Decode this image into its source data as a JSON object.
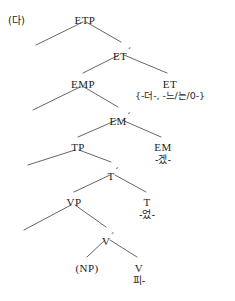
{
  "figure": {
    "example_label": "(다)",
    "width": 235,
    "height": 301,
    "line_color": "#555555",
    "text_color": "#1c1c1c"
  },
  "tree": {
    "nodes": [
      {
        "id": "ETP",
        "label": "ETP",
        "bar": "",
        "morph": "",
        "x": 85,
        "y": 14
      },
      {
        "id": "ETbar",
        "label": "ET",
        "bar": "´",
        "morph": "",
        "x": 122,
        "y": 46
      },
      {
        "id": "EMP",
        "label": "EMP",
        "bar": "",
        "morph": "",
        "x": 83,
        "y": 78
      },
      {
        "id": "ET",
        "label": "ET",
        "bar": "",
        "morph": "{-더-, -느/는/0-}",
        "x": 170,
        "y": 78
      },
      {
        "id": "EMbar",
        "label": "EM",
        "bar": "´",
        "morph": "",
        "x": 120,
        "y": 111
      },
      {
        "id": "TP",
        "label": "TP",
        "bar": "",
        "morph": "",
        "x": 78,
        "y": 141
      },
      {
        "id": "EM",
        "label": "EM",
        "bar": "",
        "morph": "-겠-",
        "x": 163,
        "y": 141
      },
      {
        "id": "Tbar",
        "label": "T",
        "bar": "´",
        "morph": "",
        "x": 113,
        "y": 166
      },
      {
        "id": "VP",
        "label": "VP",
        "bar": "",
        "morph": "",
        "x": 74,
        "y": 196
      },
      {
        "id": "T",
        "label": "T",
        "bar": "",
        "morph": "-었-",
        "x": 147,
        "y": 196
      },
      {
        "id": "Vbar",
        "label": "V",
        "bar": "´",
        "morph": "",
        "x": 108,
        "y": 231
      },
      {
        "id": "NP",
        "label": "(NP)",
        "bar": "",
        "morph": "",
        "x": 87,
        "y": 262
      },
      {
        "id": "V",
        "label": "V",
        "bar": "",
        "morph": "피-",
        "x": 139,
        "y": 262
      }
    ],
    "branches": [
      {
        "from": "ETP",
        "to": "spec-etp",
        "type": "empty-specifier"
      },
      {
        "from": "ETP",
        "to": "ETbar",
        "type": "projection"
      },
      {
        "from": "ETbar",
        "to": "EMP",
        "type": "projection"
      },
      {
        "from": "ETbar",
        "to": "ET",
        "type": "head"
      },
      {
        "from": "EMP",
        "to": "spec-emp",
        "type": "empty-specifier"
      },
      {
        "from": "EMP",
        "to": "EMbar",
        "type": "projection"
      },
      {
        "from": "EMbar",
        "to": "TP",
        "type": "projection"
      },
      {
        "from": "EMbar",
        "to": "EM",
        "type": "head"
      },
      {
        "from": "TP",
        "to": "spec-tp",
        "type": "empty-specifier"
      },
      {
        "from": "TP",
        "to": "Tbar",
        "type": "projection"
      },
      {
        "from": "Tbar",
        "to": "VP",
        "type": "projection"
      },
      {
        "from": "Tbar",
        "to": "T",
        "type": "head"
      },
      {
        "from": "VP",
        "to": "spec-vp",
        "type": "empty-specifier"
      },
      {
        "from": "VP",
        "to": "Vbar",
        "type": "projection"
      },
      {
        "from": "Vbar",
        "to": "NP",
        "type": "complement"
      },
      {
        "from": "Vbar",
        "to": "V",
        "type": "head"
      }
    ],
    "lines": [
      {
        "name": "branch-etp-spec",
        "x1": 83,
        "y1": 22,
        "x2": 36,
        "y2": 45
      },
      {
        "name": "branch-etp-etbar",
        "x1": 86,
        "y1": 22,
        "x2": 121,
        "y2": 42
      },
      {
        "name": "branch-etbar-emp",
        "x1": 119,
        "y1": 55,
        "x2": 83,
        "y2": 73
      },
      {
        "name": "branch-etbar-et",
        "x1": 124,
        "y1": 55,
        "x2": 167,
        "y2": 73
      },
      {
        "name": "branch-emp-spec",
        "x1": 80,
        "y1": 87,
        "x2": 33,
        "y2": 110
      },
      {
        "name": "branch-emp-embar",
        "x1": 84,
        "y1": 87,
        "x2": 118,
        "y2": 107
      },
      {
        "name": "branch-embar-tp",
        "x1": 117,
        "y1": 120,
        "x2": 78,
        "y2": 137
      },
      {
        "name": "branch-embar-em",
        "x1": 122,
        "y1": 120,
        "x2": 161,
        "y2": 137
      },
      {
        "name": "branch-tp-spec",
        "x1": 75,
        "y1": 150,
        "x2": 28,
        "y2": 165
      },
      {
        "name": "branch-tp-tbar",
        "x1": 79,
        "y1": 150,
        "x2": 111,
        "y2": 162
      },
      {
        "name": "branch-tbar-vp",
        "x1": 110,
        "y1": 175,
        "x2": 74,
        "y2": 192
      },
      {
        "name": "branch-tbar-t",
        "x1": 115,
        "y1": 175,
        "x2": 146,
        "y2": 192
      },
      {
        "name": "branch-vp-spec",
        "x1": 71,
        "y1": 205,
        "x2": 24,
        "y2": 230
      },
      {
        "name": "branch-vp-vbar",
        "x1": 75,
        "y1": 205,
        "x2": 106,
        "y2": 227
      },
      {
        "name": "branch-vbar-np",
        "x1": 105,
        "y1": 240,
        "x2": 87,
        "y2": 257
      },
      {
        "name": "branch-vbar-v",
        "x1": 110,
        "y1": 240,
        "x2": 137,
        "y2": 257
      }
    ]
  }
}
